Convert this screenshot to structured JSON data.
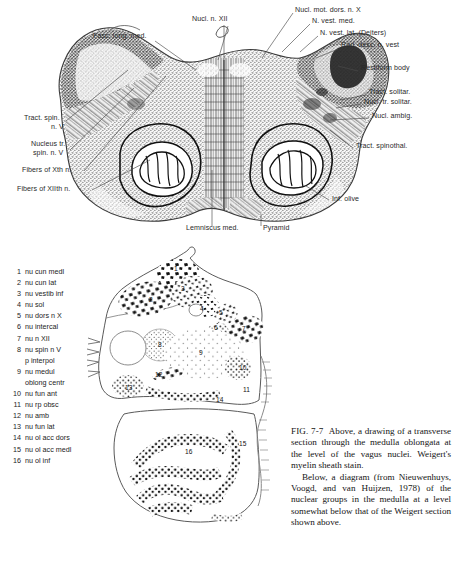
{
  "figure_number": "FIG. 7-7",
  "upper_figure": {
    "name": "weigert-myelin-sheath-stain-drawing",
    "labels": [
      {
        "id": "fasc-long-med",
        "text": "Fasc. long. med.",
        "x": 93,
        "y": 36,
        "align": "left"
      },
      {
        "id": "nucl-n-xii",
        "text": "Nucl. n. XII",
        "x": 192,
        "y": 19,
        "align": "left"
      },
      {
        "id": "nucl-mot-dors-n-x",
        "text": "Nucl. mot. dors. n. X",
        "x": 295,
        "y": 10,
        "align": "left"
      },
      {
        "id": "n-vest-med",
        "text": "N. vest. med.",
        "x": 312,
        "y": 21,
        "align": "left"
      },
      {
        "id": "n-vest-lat-deiters",
        "text": "N. vest. lat. (Deiters)",
        "x": 320,
        "y": 33,
        "align": "left"
      },
      {
        "id": "rad-desc-n-vest",
        "text": "Rad. desc. n. vest",
        "x": 340,
        "y": 45,
        "align": "left"
      },
      {
        "id": "restiform-body",
        "text": "Restiform body",
        "x": 360,
        "y": 68,
        "align": "left"
      },
      {
        "id": "tract-solitar",
        "text": "Tract. solitar.",
        "x": 368,
        "y": 92,
        "align": "left"
      },
      {
        "id": "nucl-tr-solitar",
        "text": "Nucl. tr. solitar.",
        "x": 363,
        "y": 101,
        "align": "left"
      },
      {
        "id": "nucl-ambig",
        "text": "Nucl. ambig.",
        "x": 371,
        "y": 115,
        "align": "left"
      },
      {
        "id": "tract-spinothal",
        "text": "Tract. spinothal.",
        "x": 355,
        "y": 145,
        "align": "left"
      },
      {
        "id": "inf-olive",
        "text": "Inf. olive",
        "x": 331,
        "y": 197,
        "align": "left"
      },
      {
        "id": "tract-spin-n-v-1",
        "text": "Tract. spin.",
        "x": 24,
        "y": 118,
        "align": "left"
      },
      {
        "id": "tract-spin-n-v-2",
        "text": "n. V",
        "x": 50,
        "y": 127,
        "align": "left"
      },
      {
        "id": "nucleus-tr-1",
        "text": "Nucleus tr.",
        "x": 31,
        "y": 143,
        "align": "left"
      },
      {
        "id": "nucleus-tr-2",
        "text": "spin. n. V",
        "x": 33,
        "y": 152,
        "align": "left"
      },
      {
        "id": "fibers-of-xth-n",
        "text": "Fibers of Xth n.",
        "x": 25,
        "y": 169,
        "align": "left"
      },
      {
        "id": "fibers-of-xiith-n",
        "text": "Fibers of XIIth n.",
        "x": 20,
        "y": 188,
        "align": "left"
      },
      {
        "id": "lemniscus-med",
        "text": "Lemniscus med.",
        "x": 186,
        "y": 228,
        "align": "left"
      },
      {
        "id": "pyramid",
        "text": "Pyramid",
        "x": 263,
        "y": 228,
        "align": "left"
      }
    ]
  },
  "legend": {
    "title": "nuclear group key",
    "items": [
      {
        "num": "1",
        "label": "nu cun medl"
      },
      {
        "num": "2",
        "label": "nu cun lat"
      },
      {
        "num": "3",
        "label": "nu vestib inf"
      },
      {
        "num": "4",
        "label": "nu sol"
      },
      {
        "num": "5",
        "label": "nu dors n X"
      },
      {
        "num": "6",
        "label": "nu intercal"
      },
      {
        "num": "7",
        "label": "nu n XII"
      },
      {
        "num": "8",
        "label": "nu spin n V"
      },
      {
        "num": "",
        "label": "p interpol"
      },
      {
        "num": "9",
        "label": "nu medul"
      },
      {
        "num": "",
        "label": "oblong centr"
      },
      {
        "num": "10",
        "label": "nu fun ant"
      },
      {
        "num": "11",
        "label": "nu rp obsc"
      },
      {
        "num": "12",
        "label": "nu amb"
      },
      {
        "num": "13",
        "label": "nu fun lat"
      },
      {
        "num": "14",
        "label": "nu ol acc dors"
      },
      {
        "num": "15",
        "label": "nu ol acc medl"
      },
      {
        "num": "16",
        "label": "nu ol inf"
      }
    ]
  },
  "lower_figure": {
    "name": "nieuwenhuys-nuclear-group-diagram",
    "numbers": [
      {
        "num": "1",
        "x": 92,
        "y": 24
      },
      {
        "num": "2",
        "x": 67,
        "y": 55
      },
      {
        "num": "3",
        "x": 99,
        "y": 44
      },
      {
        "num": "4",
        "x": 118,
        "y": 64
      },
      {
        "num": "5",
        "x": 137,
        "y": 68
      },
      {
        "num": "6",
        "x": 132,
        "y": 83
      },
      {
        "num": "7",
        "x": 160,
        "y": 84
      },
      {
        "num": "8",
        "x": 76,
        "y": 100
      },
      {
        "num": "9",
        "x": 117,
        "y": 108
      },
      {
        "num": "10",
        "x": 159,
        "y": 123
      },
      {
        "num": "11",
        "x": 163,
        "y": 145
      },
      {
        "num": "12",
        "x": 74,
        "y": 130
      },
      {
        "num": "13",
        "x": 44,
        "y": 143
      },
      {
        "num": "14",
        "x": 135,
        "y": 155
      },
      {
        "num": "15",
        "x": 158,
        "y": 199
      },
      {
        "num": "16",
        "x": 104,
        "y": 207
      }
    ]
  },
  "caption": {
    "figure_label": "FIG. 7-7",
    "paragraph1": "Above, a drawing of a transverse section through the medulla oblongata at the level of the vagus nuclei. Weigert's myelin sheath stain.",
    "paragraph2": "Below, a diagram (from Nieuwenhuys, Voogd, and van Huijzen, 1978) of the nuclear groups in the medulla at a level somewhat below that of the Weigert section shown above."
  }
}
